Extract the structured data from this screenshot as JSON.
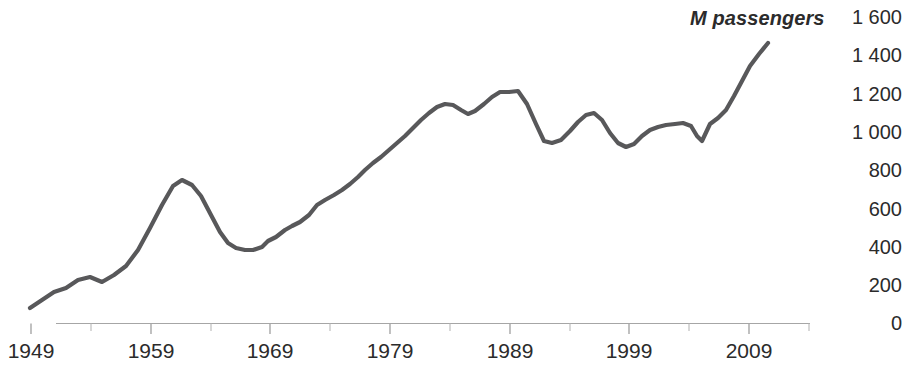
{
  "chart_data": {
    "type": "line",
    "title": "M passengers",
    "xlabel": "",
    "ylabel": "M passengers",
    "xlim": [
      1949,
      2009
    ],
    "ylim": [
      0,
      1600
    ],
    "grid": false,
    "legend": "none",
    "line_color": "#58585a",
    "axis_color": "#a6a6a6",
    "y_ticks": [
      "1 600",
      "1 400",
      "1 200",
      "1 000",
      "800",
      "600",
      "400",
      "200",
      "0"
    ],
    "y_tick_values": [
      1600,
      1400,
      1200,
      1000,
      800,
      600,
      400,
      200,
      0
    ],
    "x_ticks": [
      "1949",
      "1959",
      "1969",
      "1979",
      "1989",
      "1999",
      "2009"
    ],
    "x_tick_values": [
      1949,
      1959,
      1969,
      1979,
      1989,
      1999,
      2009
    ],
    "x_minor_tick_interval": 5,
    "series": [
      {
        "name": "M passengers",
        "x": [
          1949,
          1950,
          1951,
          1952,
          1953,
          1954,
          1955,
          1956,
          1957,
          1958,
          1959,
          1960,
          1961,
          1962,
          1963,
          1964,
          1965,
          1966,
          1967,
          1968,
          1969,
          1970,
          1971,
          1972,
          1973,
          1974,
          1975,
          1976,
          1977,
          1978,
          1979,
          1980,
          1981,
          1982,
          1983,
          1984,
          1985,
          1986,
          1987,
          1988,
          1989,
          1990,
          1991,
          1992,
          1993,
          1994,
          1995,
          1996,
          1997,
          1998,
          1999,
          2000,
          2001,
          2002,
          2003,
          2004,
          2005,
          2006,
          2007,
          2008,
          2009
        ],
        "values": [
          80,
          100,
          130,
          160,
          170,
          175,
          210,
          220,
          215,
          225,
          260,
          300,
          370,
          480,
          620,
          760,
          790,
          780,
          700,
          560,
          470,
          430,
          425,
          440,
          480,
          520,
          545,
          555,
          560,
          620,
          660,
          690,
          700,
          740,
          790,
          840,
          880,
          930,
          990,
          1055,
          1150,
          1160,
          1130,
          1170,
          1215,
          1120,
          1010,
          990,
          1010,
          1090,
          1100,
          1060,
          1005,
          985,
          1000,
          1050,
          1075,
          1080,
          1075,
          1010,
          1140
        ]
      }
    ],
    "pixel_path": "30,308 42,300 54,292 66,288 78,280 90,277 102,282 114,275 126,266 138,250 150,228 162,205 173,186 182,180 192,185 201,196 211,215 220,232 228,243 236,248 245,250 253,250 262,247 268,241 276,237 285,230 292,226 300,222 309,215 317,205 325,200 334,195 342,190 350,184 358,177 365,170 373,163 381,157 389,150 397,143 405,136 413,128 421,120 429,113 437,107 445,104 453,105 461,110 468,114 475,111 484,104 492,97 500,92 509,92 518,91 527,104 536,124 544,141 552,143 561,140 570,131 578,122 586,115 594,113 602,120 610,133 618,143 626,147 634,144 642,136 650,130 658,127 666,125 675,124 683,123 691,126 697,136 702,141 710,124 718,118 726,110 734,96 742,81 750,66 759,54 768,43"
  },
  "axis_title_text": "M passengers"
}
